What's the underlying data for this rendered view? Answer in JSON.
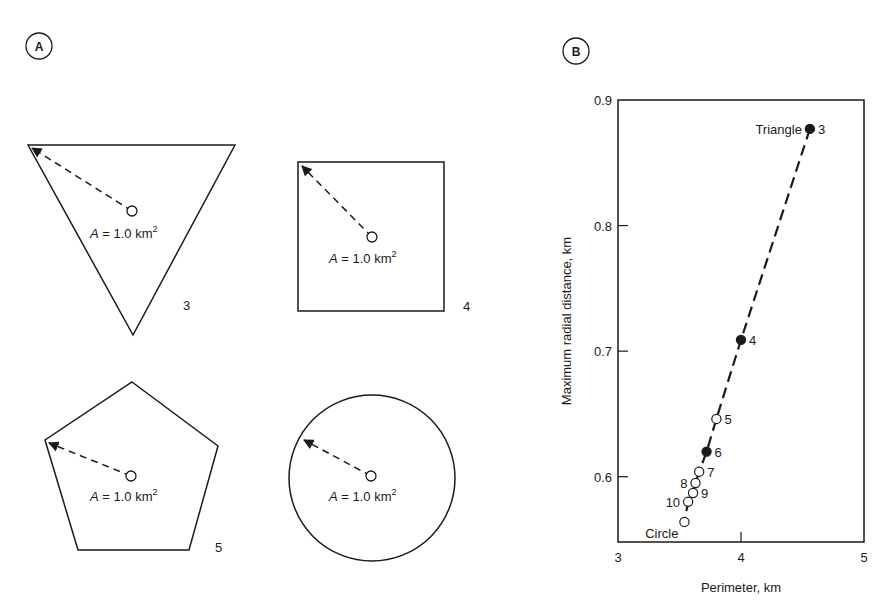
{
  "panels": {
    "a_label": "A",
    "b_label": "B"
  },
  "shapes": [
    {
      "name": "triangle",
      "sides": "3",
      "area_prefix": "A",
      "area_text": " = 1.0 km",
      "area_sup": "2"
    },
    {
      "name": "square",
      "sides": "4",
      "area_prefix": "A",
      "area_text": " = 1.0 km",
      "area_sup": "2"
    },
    {
      "name": "pentagon",
      "sides": "5",
      "area_prefix": "A",
      "area_text": " = 1.0 km",
      "area_sup": "2"
    },
    {
      "name": "circle",
      "sides": "",
      "area_prefix": "A",
      "area_text": " = 1.0 km",
      "area_sup": "2"
    }
  ],
  "chart_data": {
    "type": "scatter",
    "title": "",
    "xlabel": "Perimeter, km",
    "ylabel": "Maximum radial distance, km",
    "xlim": [
      3,
      5
    ],
    "ylim": [
      0.548,
      0.9
    ],
    "xticks": [
      "3",
      "4",
      "5"
    ],
    "xtick_values": [
      3,
      4,
      5
    ],
    "yticks": [
      "0.6",
      "0.7",
      "0.8",
      "0.9"
    ],
    "ytick_values": [
      0.6,
      0.7,
      0.8,
      0.9
    ],
    "grid": false,
    "line_style": "dashed",
    "points": [
      {
        "label": "3",
        "name": "Triangle",
        "x": 4.56,
        "y": 0.877,
        "filled": true
      },
      {
        "label": "4",
        "name": "",
        "x": 4.0,
        "y": 0.709,
        "filled": true
      },
      {
        "label": "5",
        "name": "",
        "x": 3.8,
        "y": 0.646,
        "filled": false
      },
      {
        "label": "6",
        "name": "",
        "x": 3.72,
        "y": 0.62,
        "filled": true
      },
      {
        "label": "7",
        "name": "",
        "x": 3.66,
        "y": 0.604,
        "filled": false
      },
      {
        "label": "8",
        "name": "",
        "x": 3.63,
        "y": 0.595,
        "filled": false
      },
      {
        "label": "9",
        "name": "",
        "x": 3.61,
        "y": 0.587,
        "filled": false
      },
      {
        "label": "10",
        "name": "",
        "x": 3.57,
        "y": 0.58,
        "filled": false
      },
      {
        "label": "",
        "name": "Circle",
        "x": 3.54,
        "y": 0.564,
        "filled": false
      }
    ]
  }
}
